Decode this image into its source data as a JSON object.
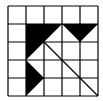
{
  "figure": {
    "grid": {
      "rows": 5,
      "cols": 5,
      "origin_x": 8,
      "origin_y": 6,
      "cell_size": 18,
      "line_color": "#000000"
    },
    "shapes": [
      {
        "name": "large-black-triangle",
        "fill": "#000000",
        "points": [
          [
            1,
            1
          ],
          [
            3,
            1
          ],
          [
            1,
            3
          ]
        ]
      },
      {
        "name": "small-black-triangle-top",
        "fill": "#000000",
        "points": [
          [
            3,
            1
          ],
          [
            5,
            1
          ],
          [
            4,
            2
          ]
        ]
      },
      {
        "name": "small-black-triangle-left",
        "fill": "#000000",
        "points": [
          [
            1,
            3
          ],
          [
            2,
            4
          ],
          [
            1,
            5
          ]
        ]
      }
    ],
    "lines": [
      {
        "name": "diagonal-line",
        "from": [
          2,
          2
        ],
        "to": [
          5,
          5
        ]
      }
    ]
  }
}
